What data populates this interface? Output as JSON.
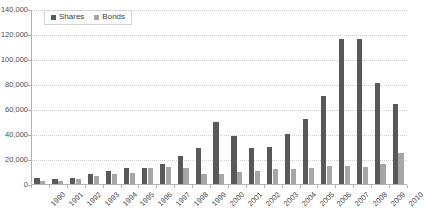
{
  "chart_data": {
    "type": "bar",
    "title": "",
    "xlabel": "",
    "ylabel": "",
    "ylim": [
      0,
      140000
    ],
    "ytick_step": 20000,
    "grid": true,
    "legend_position": "top-left",
    "categories": [
      "1990",
      "1991",
      "1992",
      "1993",
      "1994",
      "1995",
      "1996",
      "1997",
      "1998",
      "1999",
      "2000",
      "2001",
      "2002",
      "2003",
      "2004",
      "2005",
      "2006",
      "2007",
      "2008",
      "2009",
      "2010"
    ],
    "ytick_labels": [
      "140,000",
      "120,000",
      "100,000",
      "80,000",
      "60,000",
      "40,000",
      "20,000",
      "0"
    ],
    "ytick_values": [
      140000,
      120000,
      100000,
      80000,
      60000,
      40000,
      20000,
      0
    ],
    "series": [
      {
        "name": "Shares",
        "color": "#595959",
        "values": [
          5500,
          4500,
          5500,
          9000,
          11000,
          13500,
          13500,
          16500,
          23500,
          29500,
          50500,
          39500,
          29500,
          30500,
          40500,
          52500,
          71500,
          117000,
          117000,
          82000,
          65000
        ]
      },
      {
        "name": "Bonds",
        "color": "#a6a6a6",
        "values": [
          3500,
          3500,
          4500,
          7500,
          8500,
          9500,
          13500,
          14500,
          13500,
          9000,
          9000,
          10500,
          11000,
          13000,
          12500,
          13500,
          15500,
          15000,
          14500,
          16500,
          26000
        ]
      }
    ]
  },
  "legend": {
    "entries": [
      {
        "label": "Shares",
        "swatch": "shares"
      },
      {
        "label": "Bonds",
        "swatch": "bonds"
      }
    ]
  }
}
